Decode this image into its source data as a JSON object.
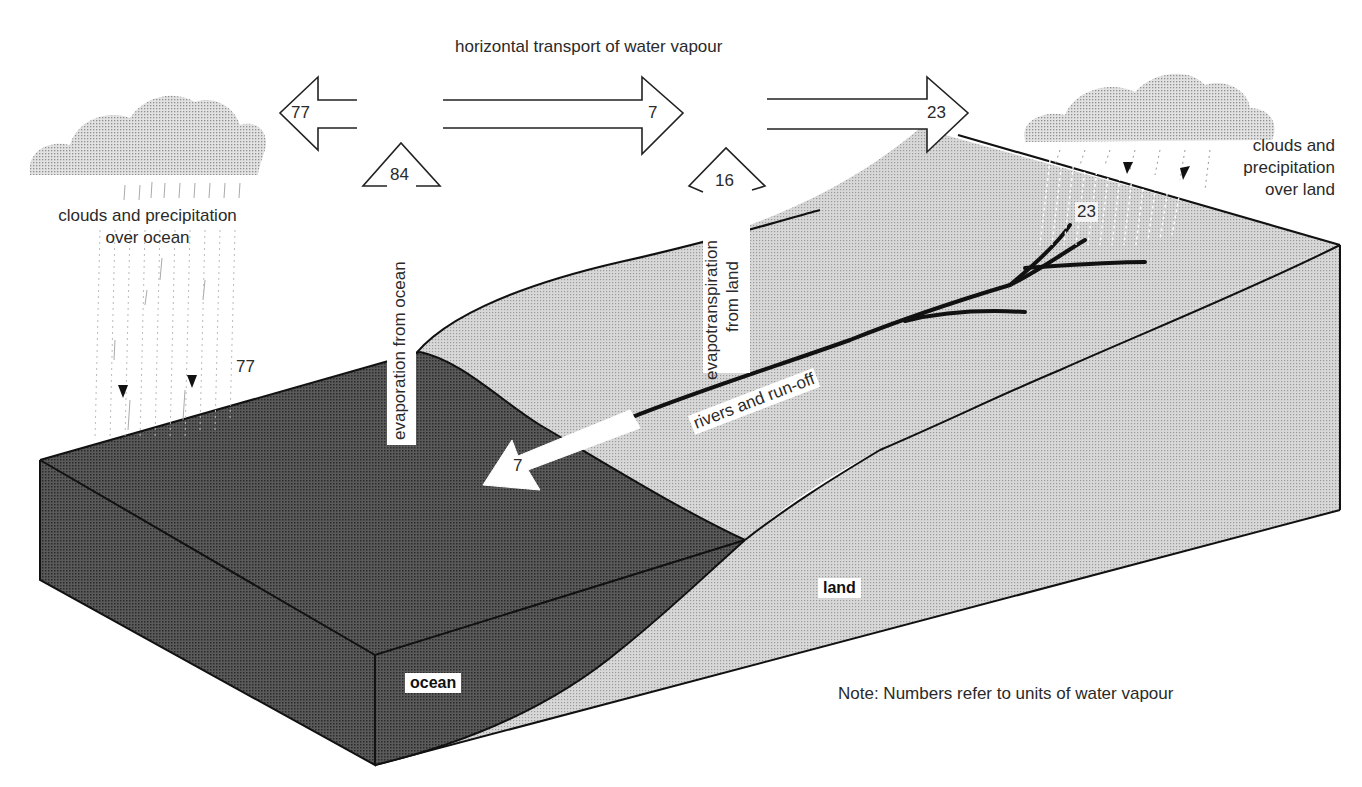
{
  "diagram": {
    "title": "horizontal transport of water vapour",
    "note": "Note: Numbers refer to units of water vapour",
    "regions": {
      "ocean": "ocean",
      "land": "land"
    },
    "clouds": {
      "ocean": {
        "line1": "clouds and precipitation",
        "line2": "over ocean",
        "value": "77"
      },
      "land": {
        "line1": "clouds and",
        "line2": "precipitation",
        "line3": "over land",
        "value": "23"
      }
    },
    "horizontal_arrows": [
      {
        "direction": "left",
        "value": "77"
      },
      {
        "direction": "right",
        "value": "7"
      },
      {
        "direction": "right",
        "value": "23"
      }
    ],
    "vertical_arrows": [
      {
        "label": "evaporation from ocean",
        "value": "84"
      },
      {
        "label_line1": "evapotranspiration",
        "label_line2": "from land",
        "value": "16"
      }
    ],
    "river": {
      "label": "rivers and run-off",
      "value": "7"
    }
  },
  "colors": {
    "ocean": "#4a4a4a",
    "ocean_side": "#3e3e3e",
    "land": "#c8c8c8",
    "land_side": "#bdbdbd",
    "cloud": "#bcbcbc",
    "line": "#111111"
  }
}
